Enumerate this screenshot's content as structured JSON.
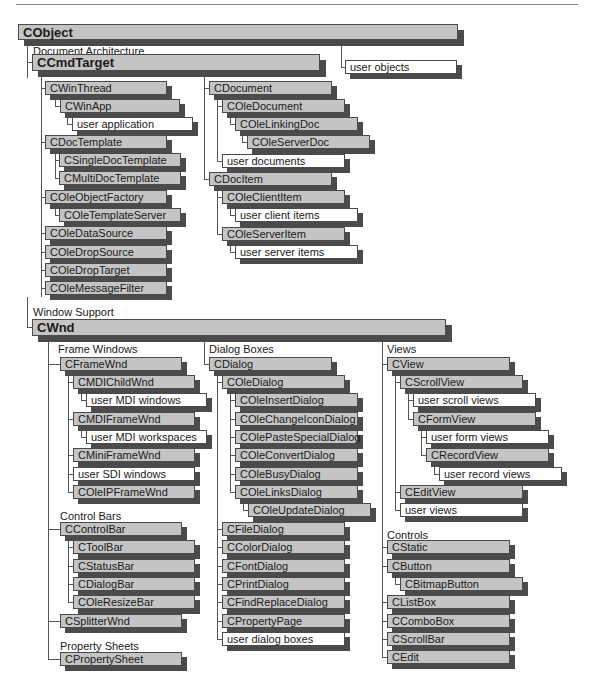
{
  "colors": {
    "class_box": "#c4c4c4",
    "user_box": "#ffffff",
    "shadow": "#4b4b4b",
    "line": "#555555"
  },
  "labels": [
    {
      "id": "doc-arch",
      "text": "Document Architecture",
      "x": 33,
      "y": 45
    },
    {
      "id": "window-support",
      "text": "Window Support",
      "x": 33,
      "y": 306
    },
    {
      "id": "frame-windows",
      "text": "Frame Windows",
      "x": 58,
      "y": 343
    },
    {
      "id": "dialog-boxes",
      "text": "Dialog Boxes",
      "x": 209,
      "y": 343
    },
    {
      "id": "views",
      "text": "Views",
      "x": 387,
      "y": 343
    },
    {
      "id": "control-bars",
      "text": "Control Bars",
      "x": 60,
      "y": 510
    },
    {
      "id": "property-sheets",
      "text": "Property Sheets",
      "x": 60,
      "y": 640
    },
    {
      "id": "controls",
      "text": "Controls",
      "x": 387,
      "y": 529
    }
  ],
  "boxes": [
    {
      "id": "cobject",
      "text": "CObject",
      "x": 18,
      "y": 24,
      "w": 440,
      "h": 16,
      "kind": "big"
    },
    {
      "id": "ccmdtarget",
      "text": "CCmdTarget",
      "x": 32,
      "y": 54,
      "w": 288,
      "h": 17,
      "kind": "big"
    },
    {
      "id": "user-objects",
      "text": "user objects",
      "x": 345,
      "y": 60,
      "w": 112,
      "h": 14,
      "kind": "user"
    },
    {
      "id": "cwinthread",
      "text": "CWinThread",
      "x": 45,
      "y": 81,
      "w": 122,
      "h": 14,
      "kind": "class"
    },
    {
      "id": "cwinapp",
      "text": "CWinApp",
      "x": 60,
      "y": 99,
      "w": 120,
      "h": 14,
      "kind": "class"
    },
    {
      "id": "user-application",
      "text": "user application",
      "x": 72,
      "y": 117,
      "w": 121,
      "h": 14,
      "kind": "user"
    },
    {
      "id": "cdoctemplate",
      "text": "CDocTemplate",
      "x": 45,
      "y": 135,
      "w": 122,
      "h": 14,
      "kind": "class"
    },
    {
      "id": "csingledoctemplate",
      "text": "CSingleDocTemplate",
      "x": 59,
      "y": 153,
      "w": 122,
      "h": 14,
      "kind": "class"
    },
    {
      "id": "cmultidoctemplate",
      "text": "CMultiDocTemplate",
      "x": 59,
      "y": 171,
      "w": 122,
      "h": 14,
      "kind": "class"
    },
    {
      "id": "coleobjectfactory",
      "text": "COleObjectFactory",
      "x": 45,
      "y": 190,
      "w": 122,
      "h": 14,
      "kind": "class"
    },
    {
      "id": "coletemplateserver",
      "text": "COleTemplateServer",
      "x": 59,
      "y": 208,
      "w": 122,
      "h": 14,
      "kind": "class"
    },
    {
      "id": "coledatasource",
      "text": "COleDataSource",
      "x": 45,
      "y": 226,
      "w": 122,
      "h": 14,
      "kind": "class"
    },
    {
      "id": "coledropsource",
      "text": "COleDropSource",
      "x": 45,
      "y": 245,
      "w": 122,
      "h": 14,
      "kind": "class"
    },
    {
      "id": "coledroptarget",
      "text": "COleDropTarget",
      "x": 45,
      "y": 263,
      "w": 122,
      "h": 14,
      "kind": "class"
    },
    {
      "id": "colemessagefilter",
      "text": "COleMessageFilter",
      "x": 45,
      "y": 281,
      "w": 122,
      "h": 14,
      "kind": "class"
    },
    {
      "id": "cdocument",
      "text": "CDocument",
      "x": 209,
      "y": 81,
      "w": 123,
      "h": 14,
      "kind": "class"
    },
    {
      "id": "coledocument",
      "text": "COleDocument",
      "x": 222,
      "y": 99,
      "w": 123,
      "h": 14,
      "kind": "class"
    },
    {
      "id": "colelinkingdoc",
      "text": "COleLinkingDoc",
      "x": 235,
      "y": 117,
      "w": 123,
      "h": 14,
      "kind": "class"
    },
    {
      "id": "coleserverdoc",
      "text": "COleServerDoc",
      "x": 247,
      "y": 135,
      "w": 123,
      "h": 14,
      "kind": "class"
    },
    {
      "id": "user-documents",
      "text": "user documents",
      "x": 222,
      "y": 154,
      "w": 123,
      "h": 14,
      "kind": "user"
    },
    {
      "id": "cdocitem",
      "text": "CDocItem",
      "x": 209,
      "y": 172,
      "w": 123,
      "h": 14,
      "kind": "class"
    },
    {
      "id": "coleclientitem",
      "text": "COleClientItem",
      "x": 222,
      "y": 190,
      "w": 123,
      "h": 14,
      "kind": "class"
    },
    {
      "id": "user-client-items",
      "text": "user client items",
      "x": 235,
      "y": 208,
      "w": 123,
      "h": 14,
      "kind": "user"
    },
    {
      "id": "coleserveritem",
      "text": "COleServerItem",
      "x": 222,
      "y": 227,
      "w": 123,
      "h": 14,
      "kind": "class"
    },
    {
      "id": "user-server-items",
      "text": "user server items",
      "x": 235,
      "y": 245,
      "w": 123,
      "h": 14,
      "kind": "user"
    },
    {
      "id": "cwnd",
      "text": "CWnd",
      "x": 32,
      "y": 319,
      "w": 414,
      "h": 17,
      "kind": "big"
    },
    {
      "id": "cframewnd",
      "text": "CFrameWnd",
      "x": 60,
      "y": 357,
      "w": 122,
      "h": 14,
      "kind": "class"
    },
    {
      "id": "cmdichildwnd",
      "text": "CMDIChildWnd",
      "x": 73,
      "y": 375,
      "w": 122,
      "h": 14,
      "kind": "class"
    },
    {
      "id": "user-mdi-windows",
      "text": "user MDI windows",
      "x": 86,
      "y": 393,
      "w": 121,
      "h": 14,
      "kind": "user"
    },
    {
      "id": "cmdiframewnd",
      "text": "CMDIFrameWnd",
      "x": 73,
      "y": 412,
      "w": 122,
      "h": 14,
      "kind": "class"
    },
    {
      "id": "user-mdi-workspaces",
      "text": "user MDI workspaces",
      "x": 86,
      "y": 430,
      "w": 121,
      "h": 14,
      "kind": "user"
    },
    {
      "id": "cminiframewnd",
      "text": "CMiniFrameWnd",
      "x": 73,
      "y": 448,
      "w": 122,
      "h": 14,
      "kind": "class"
    },
    {
      "id": "user-sdi-windows",
      "text": "user SDI windows",
      "x": 73,
      "y": 467,
      "w": 122,
      "h": 14,
      "kind": "user"
    },
    {
      "id": "coleipframewnd",
      "text": "COleIPFrameWnd",
      "x": 73,
      "y": 485,
      "w": 122,
      "h": 14,
      "kind": "class"
    },
    {
      "id": "ccontrolbar",
      "text": "CControlBar",
      "x": 60,
      "y": 522,
      "w": 122,
      "h": 14,
      "kind": "class"
    },
    {
      "id": "ctoolbar",
      "text": "CToolBar",
      "x": 73,
      "y": 540,
      "w": 122,
      "h": 14,
      "kind": "class"
    },
    {
      "id": "cstatusbar",
      "text": "CStatusBar",
      "x": 73,
      "y": 559,
      "w": 122,
      "h": 14,
      "kind": "class"
    },
    {
      "id": "cdialogbar",
      "text": "CDialogBar",
      "x": 73,
      "y": 577,
      "w": 122,
      "h": 14,
      "kind": "class"
    },
    {
      "id": "coleresizebar",
      "text": "COleResizeBar",
      "x": 73,
      "y": 595,
      "w": 122,
      "h": 14,
      "kind": "class"
    },
    {
      "id": "csplitterwnd",
      "text": "CSplitterWnd",
      "x": 60,
      "y": 614,
      "w": 122,
      "h": 14,
      "kind": "class"
    },
    {
      "id": "cpropertysheet",
      "text": "CPropertySheet",
      "x": 60,
      "y": 652,
      "w": 122,
      "h": 14,
      "kind": "class"
    },
    {
      "id": "cdialog",
      "text": "CDialog",
      "x": 209,
      "y": 357,
      "w": 123,
      "h": 14,
      "kind": "class"
    },
    {
      "id": "coledialog",
      "text": "COleDialog",
      "x": 222,
      "y": 375,
      "w": 123,
      "h": 14,
      "kind": "class"
    },
    {
      "id": "coleinsertdialog",
      "text": "COleInsertDialog",
      "x": 235,
      "y": 393,
      "w": 123,
      "h": 14,
      "kind": "class"
    },
    {
      "id": "colechangeicondialog",
      "text": "COleChangeIconDialog",
      "x": 235,
      "y": 412,
      "w": 123,
      "h": 14,
      "kind": "class"
    },
    {
      "id": "colepastespecialdialog",
      "text": "COlePasteSpecialDialog",
      "x": 235,
      "y": 430,
      "w": 123,
      "h": 14,
      "kind": "class"
    },
    {
      "id": "coleconvertdialog",
      "text": "COleConvertDialog",
      "x": 235,
      "y": 448,
      "w": 123,
      "h": 14,
      "kind": "class"
    },
    {
      "id": "colebusydialog",
      "text": "COleBusyDialog",
      "x": 235,
      "y": 467,
      "w": 123,
      "h": 14,
      "kind": "class"
    },
    {
      "id": "colelinksdialog",
      "text": "COleLinksDialog",
      "x": 235,
      "y": 485,
      "w": 123,
      "h": 14,
      "kind": "class"
    },
    {
      "id": "coleupdatedialog",
      "text": "COleUpdateDialog",
      "x": 248,
      "y": 503,
      "w": 123,
      "h": 14,
      "kind": "class"
    },
    {
      "id": "cfiledialog",
      "text": "CFileDialog",
      "x": 222,
      "y": 522,
      "w": 123,
      "h": 14,
      "kind": "class"
    },
    {
      "id": "ccolordialog",
      "text": "CColorDialog",
      "x": 222,
      "y": 540,
      "w": 123,
      "h": 14,
      "kind": "class"
    },
    {
      "id": "cfontdialog",
      "text": "CFontDialog",
      "x": 222,
      "y": 559,
      "w": 123,
      "h": 14,
      "kind": "class"
    },
    {
      "id": "cprintdialog",
      "text": "CPrintDialog",
      "x": 222,
      "y": 577,
      "w": 123,
      "h": 14,
      "kind": "class"
    },
    {
      "id": "cfindreplacedialog",
      "text": "CFindReplaceDialog",
      "x": 222,
      "y": 595,
      "w": 123,
      "h": 14,
      "kind": "class"
    },
    {
      "id": "cpropertypage",
      "text": "CPropertyPage",
      "x": 222,
      "y": 614,
      "w": 123,
      "h": 14,
      "kind": "class"
    },
    {
      "id": "user-dialog-boxes",
      "text": "user dialog boxes",
      "x": 222,
      "y": 632,
      "w": 123,
      "h": 14,
      "kind": "user"
    },
    {
      "id": "cview",
      "text": "CView",
      "x": 387,
      "y": 357,
      "w": 123,
      "h": 14,
      "kind": "class"
    },
    {
      "id": "cscrollview",
      "text": "CScrollView",
      "x": 400,
      "y": 375,
      "w": 123,
      "h": 14,
      "kind": "class"
    },
    {
      "id": "user-scroll-views",
      "text": "user scroll views",
      "x": 413,
      "y": 393,
      "w": 123,
      "h": 14,
      "kind": "user"
    },
    {
      "id": "cformview",
      "text": "CFormView",
      "x": 413,
      "y": 412,
      "w": 123,
      "h": 14,
      "kind": "class"
    },
    {
      "id": "user-form-views",
      "text": "user form views",
      "x": 426,
      "y": 430,
      "w": 123,
      "h": 14,
      "kind": "user"
    },
    {
      "id": "crecordview",
      "text": "CRecordView",
      "x": 426,
      "y": 448,
      "w": 123,
      "h": 14,
      "kind": "class"
    },
    {
      "id": "user-record-views",
      "text": "user record views",
      "x": 439,
      "y": 467,
      "w": 123,
      "h": 14,
      "kind": "user"
    },
    {
      "id": "cedittview",
      "text": "CEditView",
      "x": 400,
      "y": 485,
      "w": 123,
      "h": 14,
      "kind": "class"
    },
    {
      "id": "user-views",
      "text": "user views",
      "x": 400,
      "y": 503,
      "w": 123,
      "h": 14,
      "kind": "user"
    },
    {
      "id": "cstatic",
      "text": "CStatic",
      "x": 387,
      "y": 540,
      "w": 123,
      "h": 14,
      "kind": "class"
    },
    {
      "id": "cbutton",
      "text": "CButton",
      "x": 387,
      "y": 559,
      "w": 123,
      "h": 14,
      "kind": "class"
    },
    {
      "id": "cbitmapbutton",
      "text": "CBitmapButton",
      "x": 400,
      "y": 577,
      "w": 123,
      "h": 14,
      "kind": "class"
    },
    {
      "id": "clistbox",
      "text": "CListBox",
      "x": 387,
      "y": 595,
      "w": 123,
      "h": 14,
      "kind": "class"
    },
    {
      "id": "ccombobox",
      "text": "CComboBox",
      "x": 387,
      "y": 614,
      "w": 123,
      "h": 14,
      "kind": "class"
    },
    {
      "id": "cscrollbar",
      "text": "CScrollBar",
      "x": 387,
      "y": 632,
      "w": 123,
      "h": 14,
      "kind": "class"
    },
    {
      "id": "cedit",
      "text": "CEdit",
      "x": 387,
      "y": 650,
      "w": 123,
      "h": 14,
      "kind": "class"
    }
  ],
  "lines": [
    [
      27,
      40,
      1,
      38
    ],
    [
      27,
      62,
      6,
      1
    ],
    [
      341,
      40,
      1,
      27
    ],
    [
      341,
      67,
      4,
      1
    ],
    [
      41,
      71,
      1,
      226
    ],
    [
      41,
      88,
      4,
      1
    ],
    [
      41,
      142,
      4,
      1
    ],
    [
      41,
      197,
      4,
      1
    ],
    [
      41,
      233,
      4,
      1
    ],
    [
      41,
      252,
      4,
      1
    ],
    [
      41,
      270,
      4,
      1
    ],
    [
      41,
      288,
      4,
      1
    ],
    [
      55,
      95,
      1,
      11
    ],
    [
      55,
      106,
      5,
      1
    ],
    [
      67,
      113,
      1,
      11
    ],
    [
      67,
      124,
      5,
      1
    ],
    [
      55,
      149,
      1,
      29
    ],
    [
      55,
      160,
      4,
      1
    ],
    [
      55,
      178,
      4,
      1
    ],
    [
      55,
      204,
      1,
      11
    ],
    [
      55,
      215,
      4,
      1
    ],
    [
      204,
      71,
      1,
      108
    ],
    [
      204,
      88,
      5,
      1
    ],
    [
      204,
      179,
      5,
      1
    ],
    [
      217,
      95,
      1,
      66
    ],
    [
      217,
      106,
      5,
      1
    ],
    [
      217,
      161,
      5,
      1
    ],
    [
      230,
      113,
      1,
      11
    ],
    [
      230,
      124,
      5,
      1
    ],
    [
      242,
      131,
      1,
      11
    ],
    [
      242,
      142,
      5,
      1
    ],
    [
      217,
      186,
      1,
      48
    ],
    [
      217,
      197,
      5,
      1
    ],
    [
      217,
      234,
      5,
      1
    ],
    [
      230,
      204,
      1,
      11
    ],
    [
      230,
      215,
      5,
      1
    ],
    [
      230,
      241,
      1,
      11
    ],
    [
      230,
      252,
      5,
      1
    ],
    [
      27,
      297,
      1,
      30
    ],
    [
      27,
      327,
      5,
      1
    ],
    [
      48,
      336,
      1,
      323
    ],
    [
      48,
      364,
      12,
      1
    ],
    [
      48,
      529,
      12,
      1
    ],
    [
      48,
      621,
      12,
      1
    ],
    [
      48,
      659,
      12,
      1
    ],
    [
      68,
      371,
      1,
      121
    ],
    [
      68,
      382,
      5,
      1
    ],
    [
      68,
      419,
      5,
      1
    ],
    [
      68,
      455,
      5,
      1
    ],
    [
      68,
      474,
      5,
      1
    ],
    [
      68,
      492,
      5,
      1
    ],
    [
      81,
      389,
      1,
      11
    ],
    [
      81,
      400,
      5,
      1
    ],
    [
      81,
      426,
      1,
      11
    ],
    [
      81,
      437,
      5,
      1
    ],
    [
      68,
      536,
      1,
      66
    ],
    [
      68,
      547,
      5,
      1
    ],
    [
      68,
      566,
      5,
      1
    ],
    [
      68,
      584,
      5,
      1
    ],
    [
      68,
      602,
      5,
      1
    ],
    [
      204,
      336,
      1,
      28
    ],
    [
      204,
      364,
      5,
      1
    ],
    [
      217,
      371,
      1,
      268
    ],
    [
      217,
      382,
      5,
      1
    ],
    [
      217,
      529,
      5,
      1
    ],
    [
      217,
      547,
      5,
      1
    ],
    [
      217,
      566,
      5,
      1
    ],
    [
      217,
      584,
      5,
      1
    ],
    [
      217,
      602,
      5,
      1
    ],
    [
      217,
      621,
      5,
      1
    ],
    [
      217,
      639,
      5,
      1
    ],
    [
      230,
      389,
      1,
      103
    ],
    [
      230,
      400,
      5,
      1
    ],
    [
      230,
      419,
      5,
      1
    ],
    [
      230,
      437,
      5,
      1
    ],
    [
      230,
      455,
      5,
      1
    ],
    [
      230,
      474,
      5,
      1
    ],
    [
      230,
      492,
      5,
      1
    ],
    [
      243,
      499,
      1,
      11
    ],
    [
      243,
      510,
      5,
      1
    ],
    [
      382,
      336,
      1,
      321
    ],
    [
      382,
      364,
      5,
      1
    ],
    [
      382,
      547,
      5,
      1
    ],
    [
      382,
      566,
      5,
      1
    ],
    [
      382,
      602,
      5,
      1
    ],
    [
      382,
      621,
      5,
      1
    ],
    [
      382,
      639,
      5,
      1
    ],
    [
      382,
      657,
      5,
      1
    ],
    [
      395,
      371,
      1,
      139
    ],
    [
      395,
      382,
      5,
      1
    ],
    [
      395,
      492,
      5,
      1
    ],
    [
      395,
      510,
      5,
      1
    ],
    [
      408,
      389,
      1,
      30
    ],
    [
      408,
      400,
      5,
      1
    ],
    [
      408,
      419,
      5,
      1
    ],
    [
      421,
      426,
      1,
      29
    ],
    [
      421,
      437,
      5,
      1
    ],
    [
      421,
      455,
      5,
      1
    ],
    [
      434,
      462,
      1,
      12
    ],
    [
      434,
      474,
      5,
      1
    ],
    [
      395,
      573,
      1,
      11
    ],
    [
      395,
      584,
      5,
      1
    ]
  ]
}
